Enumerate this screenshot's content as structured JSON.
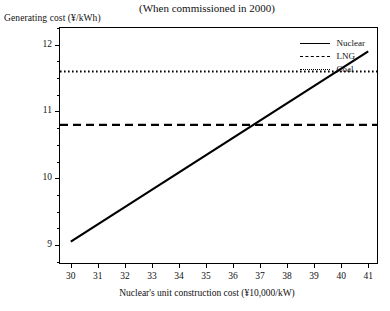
{
  "chart_title": "(When commissioned in 2000)",
  "y_axis_title": "Generating cost (¥/kWh)",
  "x_axis_title": "Nuclear's unit construction cost (¥10,000/kW)",
  "legend": {
    "items": [
      {
        "label": "Nuclear",
        "style": "solid"
      },
      {
        "label": "LNG",
        "style": "dashed"
      },
      {
        "label": "Coal",
        "style": "dotted"
      }
    ]
  },
  "axes": {
    "y_ticks": [
      "9",
      "10",
      "11",
      "12"
    ],
    "x_ticks": [
      "30",
      "31",
      "32",
      "33",
      "34",
      "35",
      "36",
      "37",
      "38",
      "39",
      "40",
      "41"
    ]
  },
  "chart_data": {
    "type": "line",
    "title": "(When commissioned in 2000)",
    "xlabel": "Nuclear's unit construction cost (¥10,000/kW)",
    "ylabel": "Generating cost (¥/kWh)",
    "xlim": [
      29.6,
      41.4
    ],
    "ylim": [
      8.7,
      12.25
    ],
    "grid": false,
    "legend_position": "top-right",
    "x_ticks": [
      30,
      31,
      32,
      33,
      34,
      35,
      36,
      37,
      38,
      39,
      40,
      41
    ],
    "y_ticks": [
      9,
      10,
      11,
      12
    ],
    "y_minor_ticks": [
      8.75,
      9.25,
      9.5,
      9.75,
      10.25,
      10.5,
      10.75,
      11.25,
      11.5,
      11.75,
      12.25
    ],
    "series": [
      {
        "name": "Nuclear",
        "style": "solid",
        "color": "#000000",
        "points": [
          [
            30,
            9.05
          ],
          [
            41,
            11.9
          ]
        ]
      },
      {
        "name": "LNG",
        "style": "dashed",
        "color": "#000000",
        "constant": 10.8,
        "points": [
          [
            29.6,
            10.8
          ],
          [
            41.4,
            10.8
          ]
        ]
      },
      {
        "name": "Coal",
        "style": "dotted",
        "color": "#000000",
        "constant": 11.6,
        "points": [
          [
            29.6,
            11.6
          ],
          [
            41.4,
            11.6
          ]
        ]
      }
    ],
    "intersections": [
      {
        "series": [
          "Nuclear",
          "LNG"
        ],
        "x": 36.8,
        "y": 10.8
      },
      {
        "series": [
          "Nuclear",
          "Coal"
        ],
        "x": 39.9,
        "y": 11.6
      }
    ]
  }
}
